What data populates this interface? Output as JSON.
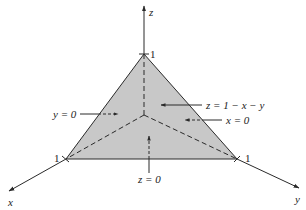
{
  "diagram": {
    "title": "",
    "colors": {
      "plane_fill": "#c8c8c8",
      "line": "#2a2a2a",
      "background": "#ffffff"
    },
    "axes": {
      "x_label": "x",
      "y_label": "y",
      "z_label": "z"
    },
    "ticks": {
      "x_tick": "1",
      "y_tick": "1",
      "z_tick": "1"
    },
    "annotations": {
      "plane_equation": "z = 1 − x − y",
      "face_x0": "x = 0",
      "face_y0": "y = 0",
      "face_z0": "z = 0"
    }
  }
}
